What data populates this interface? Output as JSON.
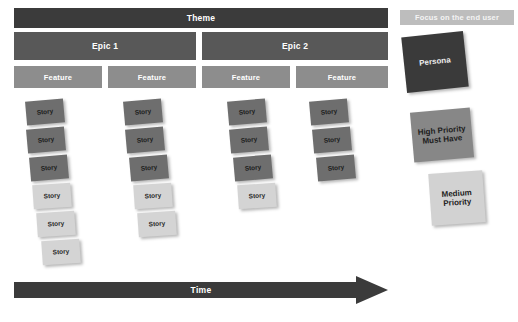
{
  "diagram": {
    "background_color": "#ffffff"
  },
  "backbone": {
    "theme": {
      "label": "Theme",
      "color": "#3b3b3b",
      "x": 14,
      "y": 8,
      "width": 374,
      "height": 20
    },
    "epics": [
      {
        "label": "Epic 1",
        "color": "#585858",
        "x": 14,
        "y": 32,
        "width": 182,
        "height": 28
      },
      {
        "label": "Epic 2",
        "color": "#585858",
        "x": 202,
        "y": 32,
        "width": 186,
        "height": 28
      }
    ],
    "features": [
      {
        "label": "Feature",
        "color": "#8d8d8d",
        "x": 14,
        "y": 66,
        "width": 88,
        "height": 22
      },
      {
        "label": "Feature",
        "color": "#8d8d8d",
        "x": 108,
        "y": 66,
        "width": 88,
        "height": 22
      },
      {
        "label": "Feature",
        "color": "#8d8d8d",
        "x": 202,
        "y": 66,
        "width": 88,
        "height": 22
      },
      {
        "label": "Feature",
        "color": "#8d8d8d",
        "x": 296,
        "y": 66,
        "width": 92,
        "height": 22
      }
    ]
  },
  "story_columns": [
    {
      "column_index": 0,
      "card_count": 6,
      "cards": [
        {
          "label": "Story",
          "priority": "dark",
          "color": "#6e6e6e",
          "x": 26,
          "y": 100,
          "rotate": -5
        },
        {
          "label": "Story",
          "priority": "dark",
          "color": "#6e6e6e",
          "x": 27,
          "y": 128,
          "rotate": -5
        },
        {
          "label": "Story",
          "priority": "dark",
          "color": "#6e6e6e",
          "x": 30,
          "y": 156,
          "rotate": -5
        },
        {
          "label": "Story",
          "priority": "light",
          "color": "#d4d4d4",
          "x": 33,
          "y": 184,
          "rotate": -4
        },
        {
          "label": "Story",
          "priority": "light",
          "color": "#d4d4d4",
          "x": 37,
          "y": 212,
          "rotate": -4
        },
        {
          "label": "Story",
          "priority": "light",
          "color": "#d4d4d4",
          "x": 42,
          "y": 240,
          "rotate": -4
        }
      ]
    },
    {
      "column_index": 1,
      "card_count": 5,
      "cards": [
        {
          "label": "Story",
          "priority": "dark",
          "color": "#6e6e6e",
          "x": 124,
          "y": 100,
          "rotate": -5
        },
        {
          "label": "Story",
          "priority": "dark",
          "color": "#6e6e6e",
          "x": 126,
          "y": 128,
          "rotate": -5
        },
        {
          "label": "Story",
          "priority": "dark",
          "color": "#6e6e6e",
          "x": 130,
          "y": 156,
          "rotate": -5
        },
        {
          "label": "Story",
          "priority": "light",
          "color": "#d4d4d4",
          "x": 134,
          "y": 184,
          "rotate": -4
        },
        {
          "label": "Story",
          "priority": "light",
          "color": "#d4d4d4",
          "x": 138,
          "y": 212,
          "rotate": -4
        }
      ]
    },
    {
      "column_index": 2,
      "card_count": 4,
      "cards": [
        {
          "label": "Story",
          "priority": "dark",
          "color": "#6e6e6e",
          "x": 228,
          "y": 100,
          "rotate": -5
        },
        {
          "label": "Story",
          "priority": "dark",
          "color": "#6e6e6e",
          "x": 230,
          "y": 128,
          "rotate": -5
        },
        {
          "label": "Story",
          "priority": "dark",
          "color": "#6e6e6e",
          "x": 234,
          "y": 156,
          "rotate": -5
        },
        {
          "label": "Story",
          "priority": "light",
          "color": "#d4d4d4",
          "x": 238,
          "y": 184,
          "rotate": -4
        }
      ]
    },
    {
      "column_index": 3,
      "card_count": 3,
      "cards": [
        {
          "label": "Story",
          "priority": "dark",
          "color": "#6e6e6e",
          "x": 310,
          "y": 100,
          "rotate": -5
        },
        {
          "label": "Story",
          "priority": "dark",
          "color": "#6e6e6e",
          "x": 313,
          "y": 128,
          "rotate": -5
        },
        {
          "label": "Story",
          "priority": "dark",
          "color": "#6e6e6e",
          "x": 317,
          "y": 156,
          "rotate": -5
        }
      ]
    }
  ],
  "time_axis": {
    "label": "Time",
    "color": "#3b3b3b",
    "direction": "right"
  },
  "legend": {
    "focus_banner": {
      "label": "Focus on the end user",
      "color": "#bdbdbd",
      "x": 400,
      "y": 10,
      "width": 114,
      "height": 15
    },
    "cards": [
      {
        "label": "Persona",
        "color": "#3a3a3a",
        "text_color": "#ededed",
        "x": 404,
        "y": 34,
        "width": 62,
        "height": 56,
        "rotate": -6
      },
      {
        "label": "High Priority\nMust Have",
        "line1": "High Priority",
        "line2": "Must Have",
        "color": "#878787",
        "x": 412,
        "y": 110,
        "width": 60,
        "height": 50,
        "rotate": -5
      },
      {
        "label": "Medium\nPriority",
        "line1": "Medium",
        "line2": "Priority",
        "color": "#d2d2d2",
        "x": 430,
        "y": 172,
        "width": 54,
        "height": 52,
        "rotate": -4
      }
    ]
  }
}
